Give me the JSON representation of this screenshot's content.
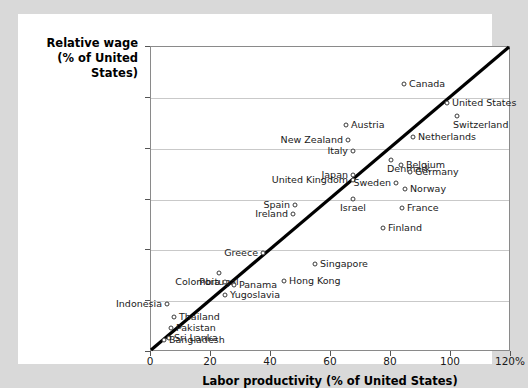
{
  "chart_data": {
    "type": "scatter",
    "title": "",
    "xlabel": "Labor productivity (% of United States)",
    "ylabel": "Relative wage\n(% of United\nStates)",
    "ylabel_lines": [
      "Relative wage",
      "(% of United",
      "States)"
    ],
    "xlim": [
      0,
      120
    ],
    "ylim": [
      0,
      120
    ],
    "xticks": [
      "0",
      "20",
      "40",
      "60",
      "80",
      "100",
      "120%"
    ],
    "xtick_values": [
      0,
      20,
      40,
      60,
      80,
      100,
      120
    ],
    "yticks": [
      "0",
      "20",
      "40",
      "60",
      "80",
      "100",
      "120%"
    ],
    "ytick_values": [
      0,
      20,
      40,
      60,
      80,
      100,
      120
    ],
    "grid": "horizontal",
    "legend": "none",
    "reference_line": {
      "label": "45-degree line",
      "from": [
        0,
        0
      ],
      "to": [
        120,
        120
      ]
    },
    "point_color": "#ffffff",
    "point_edge_color": "#3a3a3a",
    "line_color": "#000000",
    "grid_color": "#c9c9c9",
    "points": [
      {
        "name": "Canada",
        "x": 84.5,
        "y": 120.0,
        "px": 385,
        "py": 69,
        "side": "r"
      },
      {
        "name": "United States",
        "x": 100.0,
        "y": 100.0,
        "px": 428,
        "py": 88,
        "side": "r"
      },
      {
        "name": "Switzerland",
        "x": 103.5,
        "y": 93.0,
        "px": 438,
        "py": 101,
        "side": "r2"
      },
      {
        "name": "Austria",
        "x": 65.0,
        "y": 89.5,
        "px": 327,
        "py": 110,
        "side": "r"
      },
      {
        "name": "New Zealand",
        "x": 65.5,
        "y": 83.5,
        "px": 329,
        "py": 125,
        "side": "l"
      },
      {
        "name": "Netherlands",
        "x": 87.0,
        "y": 84.5,
        "px": 394,
        "py": 122,
        "side": "r"
      },
      {
        "name": "Italy",
        "x": 67.0,
        "y": 79.0,
        "px": 334,
        "py": 136,
        "side": "l"
      },
      {
        "name": "Denmark",
        "x": 80.0,
        "y": 75.5,
        "px": 372,
        "py": 145,
        "side": "r2"
      },
      {
        "name": "Belgium",
        "x": 83.0,
        "y": 73.5,
        "px": 382,
        "py": 150,
        "side": "r"
      },
      {
        "name": "Germany",
        "x": 86.0,
        "y": 71.0,
        "px": 391,
        "py": 157,
        "side": "r"
      },
      {
        "name": "Japan",
        "x": 67.5,
        "y": 69.5,
        "px": 334,
        "py": 160,
        "side": "l"
      },
      {
        "name": "United Kingdom",
        "x": 67.5,
        "y": 67.5,
        "px": 334,
        "py": 165,
        "side": "l"
      },
      {
        "name": "Sweden",
        "x": 81.5,
        "y": 66.5,
        "px": 377,
        "py": 168,
        "side": "l"
      },
      {
        "name": "Norway",
        "x": 84.5,
        "y": 64.0,
        "px": 386,
        "py": 174,
        "side": "r"
      },
      {
        "name": "Israel",
        "x": 67.5,
        "y": 60.0,
        "px": 334,
        "py": 184,
        "side": "c"
      },
      {
        "name": "France",
        "x": 83.5,
        "y": 56.5,
        "px": 383,
        "py": 193,
        "side": "r"
      },
      {
        "name": "Spain",
        "x": 48.0,
        "y": 57.5,
        "px": 276,
        "py": 190,
        "side": "l"
      },
      {
        "name": "Ireland",
        "x": 47.5,
        "y": 54.0,
        "px": 274,
        "py": 199,
        "side": "l"
      },
      {
        "name": "Finland",
        "x": 77.5,
        "y": 48.5,
        "px": 364,
        "py": 213,
        "side": "r"
      },
      {
        "name": "Greece",
        "x": 37.5,
        "y": 39.0,
        "px": 244,
        "py": 238,
        "side": "l"
      },
      {
        "name": "Singapore",
        "x": 54.5,
        "y": 34.5,
        "px": 296,
        "py": 249,
        "side": "r"
      },
      {
        "name": "Portugal",
        "x": 22.5,
        "y": 31.0,
        "px": 200,
        "py": 258,
        "side": "c"
      },
      {
        "name": "Colombia",
        "x": 24.5,
        "y": 27.5,
        "px": 206,
        "py": 267,
        "side": "l"
      },
      {
        "name": "Panama",
        "x": 27.5,
        "y": 26.5,
        "px": 215,
        "py": 270,
        "side": "r"
      },
      {
        "name": "Hong Kong",
        "x": 44.5,
        "y": 27.5,
        "px": 265,
        "py": 266,
        "side": "r"
      },
      {
        "name": "Yugoslavia",
        "x": 24.5,
        "y": 22.5,
        "px": 206,
        "py": 280,
        "side": "r"
      },
      {
        "name": "Indonesia",
        "x": 5.5,
        "y": 19.0,
        "px": 148,
        "py": 289,
        "side": "l"
      },
      {
        "name": "Thailand",
        "x": 7.5,
        "y": 14.0,
        "px": 155,
        "py": 302,
        "side": "r"
      },
      {
        "name": "Pakistan",
        "x": 6.5,
        "y": 9.5,
        "px": 152,
        "py": 313,
        "side": "r"
      },
      {
        "name": "Sri Lanka",
        "x": 6.0,
        "y": 5.5,
        "px": 150,
        "py": 323,
        "side": "r"
      },
      {
        "name": "Bangladesh",
        "x": 4.5,
        "y": 4.5,
        "px": 145,
        "py": 325,
        "side": "r"
      }
    ]
  },
  "axis": {
    "y_title_lines": [
      "Relative wage",
      "(% of United",
      "States)"
    ],
    "x_title": "Labor productivity (% of United States)"
  }
}
